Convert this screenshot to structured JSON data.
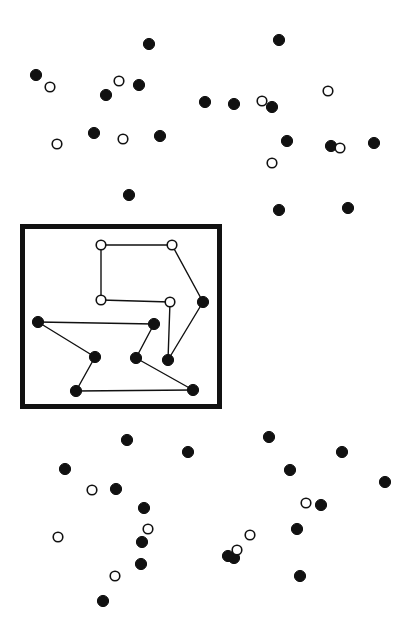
{
  "figure": {
    "width": 407,
    "height": 643,
    "background_color": "#ffffff",
    "marker_color_filled": "#111111",
    "marker_color_hollow_fill": "#ffffff",
    "marker_stroke_color": "#111111",
    "marker_radius": 5.6,
    "marker_radius_hollow": 4.8
  },
  "region_box": {
    "label": "highlighted-region",
    "x": 20,
    "y": 224,
    "width": 202,
    "height": 185,
    "stroke_width": 5,
    "stroke_color": "#111111"
  },
  "chart_data": {
    "type": "scatter",
    "xlabel": "",
    "ylabel": "",
    "xlim": [
      0,
      407
    ],
    "ylim": [
      0,
      643
    ],
    "grid": false,
    "legend": null,
    "coordinate_system": "pixel (origin top-left, y increases downward)",
    "series": [
      {
        "name": "filled-points-outside-region",
        "marker": "filled-circle",
        "color": "#111111",
        "points": [
          [
            149,
            44
          ],
          [
            279,
            40
          ],
          [
            36,
            75
          ],
          [
            106,
            95
          ],
          [
            139,
            85
          ],
          [
            94,
            133
          ],
          [
            160,
            136
          ],
          [
            205,
            102
          ],
          [
            234,
            104
          ],
          [
            272,
            107
          ],
          [
            287,
            141
          ],
          [
            331,
            146
          ],
          [
            374,
            143
          ],
          [
            129,
            195
          ],
          [
            279,
            210
          ],
          [
            348,
            208
          ],
          [
            127,
            440
          ],
          [
            188,
            452
          ],
          [
            269,
            437
          ],
          [
            342,
            452
          ],
          [
            65,
            469
          ],
          [
            116,
            489
          ],
          [
            144,
            508
          ],
          [
            290,
            470
          ],
          [
            321,
            505
          ],
          [
            385,
            482
          ],
          [
            142,
            542
          ],
          [
            234,
            558
          ],
          [
            297,
            529
          ],
          [
            141,
            564
          ],
          [
            228,
            556
          ],
          [
            300,
            576
          ],
          [
            103,
            601
          ]
        ]
      },
      {
        "name": "hollow-points-outside-region",
        "marker": "hollow-circle",
        "color": "#111111",
        "points": [
          [
            50,
            87
          ],
          [
            119,
            81
          ],
          [
            57,
            144
          ],
          [
            123,
            139
          ],
          [
            262,
            101
          ],
          [
            328,
            91
          ],
          [
            340,
            148
          ],
          [
            272,
            163
          ],
          [
            92,
            490
          ],
          [
            58,
            537
          ],
          [
            115,
            576
          ],
          [
            148,
            529
          ],
          [
            237,
            550
          ],
          [
            306,
            503
          ],
          [
            250,
            535
          ]
        ]
      },
      {
        "name": "graph-nodes-hollow-inside-region",
        "marker": "hollow-circle",
        "color": "#111111",
        "points": [
          [
            101,
            245
          ],
          [
            172,
            245
          ],
          [
            101,
            300
          ],
          [
            170,
            302
          ]
        ]
      },
      {
        "name": "graph-nodes-filled-inside-region",
        "marker": "filled-circle",
        "color": "#111111",
        "points": [
          [
            203,
            302
          ],
          [
            38,
            322
          ],
          [
            154,
            324
          ],
          [
            95,
            357
          ],
          [
            136,
            358
          ],
          [
            168,
            360
          ],
          [
            76,
            391
          ],
          [
            193,
            390
          ]
        ]
      }
    ],
    "edges": [
      [
        [
          101,
          245
        ],
        [
          172,
          245
        ]
      ],
      [
        [
          101,
          245
        ],
        [
          101,
          300
        ]
      ],
      [
        [
          172,
          245
        ],
        [
          203,
          302
        ]
      ],
      [
        [
          101,
          300
        ],
        [
          170,
          302
        ]
      ],
      [
        [
          203,
          302
        ],
        [
          168,
          360
        ]
      ],
      [
        [
          170,
          302
        ],
        [
          168,
          360
        ]
      ],
      [
        [
          38,
          322
        ],
        [
          154,
          324
        ]
      ],
      [
        [
          38,
          322
        ],
        [
          95,
          357
        ]
      ],
      [
        [
          95,
          357
        ],
        [
          76,
          391
        ]
      ],
      [
        [
          154,
          324
        ],
        [
          136,
          358
        ]
      ],
      [
        [
          136,
          358
        ],
        [
          193,
          390
        ]
      ],
      [
        [
          76,
          391
        ],
        [
          193,
          390
        ]
      ]
    ]
  }
}
